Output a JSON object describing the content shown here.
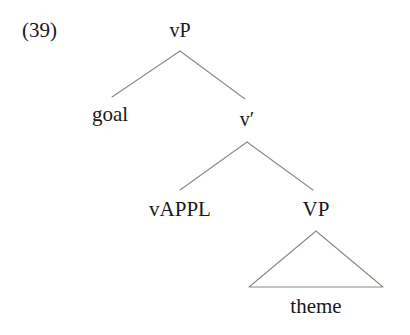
{
  "figure": {
    "example_number": "(39)",
    "background_color": "#ffffff",
    "line_color": "#8b8b81",
    "text_color": "#19191c"
  },
  "tree": {
    "nodes": [
      {
        "id": "vP",
        "label": "vP",
        "x": 180,
        "y": 30
      },
      {
        "id": "goal",
        "label": "goal",
        "x": 110,
        "y": 114
      },
      {
        "id": "vbar",
        "label": "v′",
        "x": 247,
        "y": 119
      },
      {
        "id": "vAPPL",
        "label": "vAPPL",
        "x": 180,
        "y": 209
      },
      {
        "id": "VP",
        "label": "VP",
        "x": 316,
        "y": 209
      },
      {
        "id": "theme",
        "label": "theme",
        "x": 316,
        "y": 306
      }
    ],
    "branches": [
      {
        "from": "vP",
        "to": "goal",
        "x1": 180,
        "y1": 51,
        "x2": 112,
        "y2": 97
      },
      {
        "from": "vP",
        "to": "vbar",
        "x1": 180,
        "y1": 51,
        "x2": 245,
        "y2": 99
      },
      {
        "from": "vbar",
        "to": "vAPPL",
        "x1": 247,
        "y1": 142,
        "x2": 180,
        "y2": 190
      },
      {
        "from": "vbar",
        "to": "VP",
        "x1": 247,
        "y1": 142,
        "x2": 313,
        "y2": 190
      }
    ],
    "triangle": {
      "parent": "VP",
      "label": "theme",
      "apex_x": 316,
      "apex_y": 231,
      "left_x": 249,
      "right_x": 383,
      "base_y": 287
    }
  }
}
